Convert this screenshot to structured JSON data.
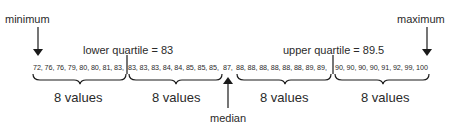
{
  "labels": {
    "minimum": "minimum",
    "maximum": "maximum",
    "lower_quartile": "lower quartile = 83",
    "upper_quartile": "upper quartile = 89.5",
    "median": "median"
  },
  "groups": [
    {
      "values_text": "72, 76, 76, 79, 80, 80, 81, 83,",
      "count_label": "8 values"
    },
    {
      "values_text": "83, 83, 83, 84, 84, 85, 85, 85,",
      "count_label": "8 values"
    },
    {
      "median_value_text": "87,"
    },
    {
      "values_text": "88, 88, 88, 88, 88, 88, 89, 89,",
      "count_label": "8 values"
    },
    {
      "values_text": "90, 90, 90, 90, 91, 92, 99, 100",
      "count_label": "8 values"
    }
  ],
  "data": {
    "values": [
      72,
      76,
      76,
      79,
      80,
      80,
      81,
      83,
      83,
      83,
      83,
      84,
      84,
      85,
      85,
      85,
      87,
      88,
      88,
      88,
      88,
      88,
      88,
      89,
      89,
      90,
      90,
      90,
      90,
      91,
      92,
      99,
      100
    ],
    "minimum": 72,
    "maximum": 100,
    "median": 87,
    "lower_quartile": 83,
    "upper_quartile": 89.5
  }
}
